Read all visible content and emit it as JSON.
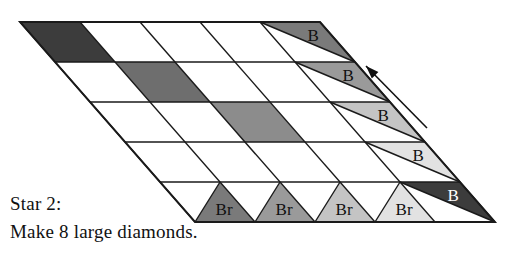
{
  "figure": {
    "title_semantic": "quilt-block-piecing-diagram",
    "caption_line1": "Star 2:",
    "caption_line2": "Make 8 large diamonds.",
    "arrow": {
      "name": "direction-arrow",
      "direction": "up-left",
      "from": [
        427,
        128
      ],
      "to": [
        366,
        66
      ]
    }
  },
  "grid": {
    "rows": 5,
    "cols": 5,
    "corners": {
      "top_left": [
        20,
        22
      ],
      "top_right": [
        320,
        22
      ],
      "bottom_right": [
        495,
        222
      ],
      "bottom_left": [
        195,
        222
      ]
    },
    "cell_width": 60,
    "row_height": 40,
    "row_shear": 35,
    "stroke_color": "#1a1a1a",
    "stroke_width": 1.4,
    "fill_empty": "#ffffff"
  },
  "palette": {
    "dark": "#3c3c3c",
    "medium_dark": "#6e6e6e",
    "medium": "#8c8c8c",
    "light": "#b4b4b4",
    "very_light": "#d8d8d8",
    "pale": "#ededed",
    "white": "#ffffff",
    "outline": "#1a1a1a"
  },
  "shaded_cells": [
    {
      "row": 0,
      "col": 0,
      "shade": "#3c3c3c",
      "label": ""
    },
    {
      "row": 1,
      "col": 1,
      "shade": "#6e6e6e",
      "label": ""
    },
    {
      "row": 2,
      "col": 2,
      "shade": "#8c8c8c",
      "label": ""
    },
    {
      "row": 3,
      "col": 3,
      "shade": "#ffffff",
      "label": ""
    },
    {
      "row": 4,
      "col": 4,
      "shade": "#ffffff",
      "label": ""
    }
  ],
  "right_edge_triangles": [
    {
      "index": 0,
      "row": 0,
      "label": "B",
      "shade": "#7a7a7a",
      "text_color": "#111111"
    },
    {
      "index": 1,
      "row": 1,
      "label": "B",
      "shade": "#9a9a9a",
      "text_color": "#111111"
    },
    {
      "index": 2,
      "row": 2,
      "label": "B",
      "shade": "#c4c4c4",
      "text_color": "#111111"
    },
    {
      "index": 3,
      "row": 3,
      "label": "B",
      "shade": "#e2e2e2",
      "text_color": "#111111"
    },
    {
      "index": 4,
      "row": 4,
      "label": "B",
      "shade": "#3c3c3c",
      "text_color": "#ffffff"
    }
  ],
  "bottom_edge_triangles": [
    {
      "index": 0,
      "col": 0,
      "label": "Br",
      "shade": "#7a7a7a",
      "text_color": "#111111"
    },
    {
      "index": 1,
      "col": 1,
      "label": "Br",
      "shade": "#9a9a9a",
      "text_color": "#111111"
    },
    {
      "index": 2,
      "col": 2,
      "label": "Br",
      "shade": "#c4c4c4",
      "text_color": "#111111"
    },
    {
      "index": 3,
      "col": 3,
      "label": "Br",
      "shade": "#e2e2e2",
      "text_color": "#111111"
    }
  ],
  "labels": {
    "b": "B",
    "br": "Br"
  }
}
